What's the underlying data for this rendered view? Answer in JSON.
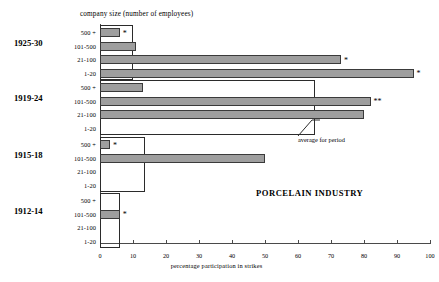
{
  "chart_data": {
    "type": "bar",
    "orientation": "horizontal",
    "title": "PORCELAIN INDUSTRY",
    "group_title": "company size (number of employees)",
    "xlabel": "percentage participation in strikes",
    "ylabel": "",
    "xlim": [
      0,
      100
    ],
    "xticks": [
      0,
      10,
      20,
      30,
      40,
      50,
      60,
      70,
      80,
      90,
      100
    ],
    "grid": false,
    "legend": "none",
    "categories": [
      "500 +",
      "101-500",
      "21-100",
      "1-20"
    ],
    "annotation": "average for period",
    "series": [
      {
        "name": "1925-30",
        "average": 10,
        "values": [
          6,
          11,
          73,
          95
        ],
        "markers": [
          "*",
          "",
          "*",
          "*"
        ]
      },
      {
        "name": "1919-24",
        "average": 65,
        "values": [
          13,
          82,
          80,
          0
        ],
        "markers": [
          "",
          "**",
          "",
          ""
        ]
      },
      {
        "name": "1915-18",
        "average": 13.5,
        "values": [
          3,
          50,
          0,
          0
        ],
        "markers": [
          "*",
          "",
          "",
          ""
        ]
      },
      {
        "name": "1912-14",
        "average": 6,
        "values": [
          0,
          6,
          0,
          0
        ],
        "markers": [
          "",
          "*",
          "",
          ""
        ]
      }
    ]
  },
  "colors": {
    "bar_fill": "#9e9e9e",
    "bar_stroke": "#3a3a3a",
    "axis": "#4a4a4a",
    "text": "#000000"
  }
}
